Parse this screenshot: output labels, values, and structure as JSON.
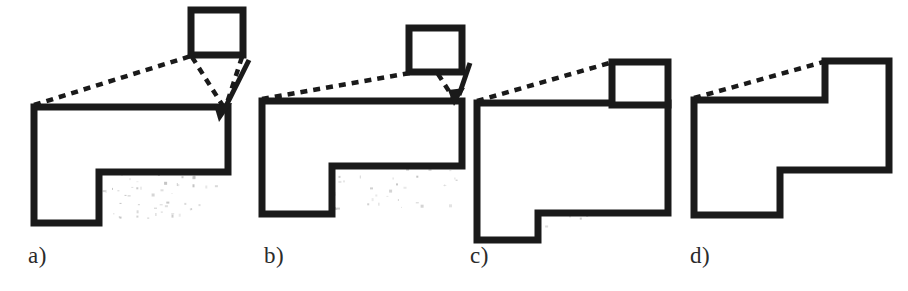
{
  "figure": {
    "kind": "line-drawing-diagram",
    "background_color": "#ffffff",
    "stroke_color": "#1a1a1a",
    "fill_color": "#ffffff",
    "dash_color": "#1a1a1a",
    "label_color": "#2b2b2b",
    "stroke_width": 7,
    "dash_width": 4,
    "dash_pattern": "7 6"
  },
  "labels": {
    "a": "a)",
    "b": "b)",
    "c": "c)",
    "d": "d)"
  },
  "panels": [
    {
      "id": "a",
      "label": "a)",
      "has_inset_box": true,
      "has_arrow": true,
      "dashed_line_count": 3,
      "inset_box": {
        "x": 191,
        "y": 10,
        "width": 52,
        "height": 45
      },
      "polygon_points": "34,107 228,107 228,172 99,172 99,223 34,223",
      "dash_lines": [
        {
          "x1": 34,
          "y1": 105,
          "x2": 191,
          "y2": 56
        },
        {
          "x1": 192,
          "y1": 57,
          "x2": 223,
          "y2": 106
        },
        {
          "x1": 242,
          "y1": 57,
          "x2": 226,
          "y2": 106
        }
      ],
      "arrow": {
        "x1": 247,
        "y1": 62,
        "x2": 221,
        "y2": 113
      }
    },
    {
      "id": "b",
      "label": "b)",
      "has_inset_box": true,
      "has_arrow": true,
      "dashed_line_count": 2,
      "inset_box": {
        "x": 409,
        "y": 28,
        "width": 53,
        "height": 44
      },
      "polygon_points": "262,101 462,101 462,166 332,166 332,214 262,214",
      "dash_lines": [
        {
          "x1": 262,
          "y1": 99,
          "x2": 409,
          "y2": 73
        },
        {
          "x1": 440,
          "y1": 74,
          "x2": 455,
          "y2": 99
        }
      ],
      "arrow": {
        "x1": 469,
        "y1": 62,
        "x2": 455,
        "y2": 100
      }
    },
    {
      "id": "c",
      "label": "c)",
      "has_inset_box": false,
      "has_arrow": false,
      "dashed_line_count": 1,
      "attached_box": {
        "x": 612,
        "y": 62,
        "width": 56,
        "height": 41
      },
      "polygon_points": "477,103 668,103 668,213 538,213 538,240 477,240",
      "dash_lines": [
        {
          "x1": 477,
          "y1": 101,
          "x2": 612,
          "y2": 62
        }
      ]
    },
    {
      "id": "d",
      "label": "d)",
      "has_inset_box": false,
      "has_arrow": false,
      "dashed_line_count": 1,
      "polygon_points": "694,100 825,100 825,61 889,61 889,170 780,170 780,215 694,215",
      "dash_lines": [
        {
          "x1": 694,
          "y1": 98,
          "x2": 826,
          "y2": 61
        }
      ]
    }
  ],
  "speckles": {
    "note": "scanner noise inside the large polygons of panels a, b and c",
    "color": "#b9b9b9",
    "clusters": [
      {
        "panel": "a",
        "x": 40,
        "y": 112,
        "width": 185,
        "height": 108,
        "count": 150
      },
      {
        "panel": "b",
        "x": 266,
        "y": 106,
        "width": 192,
        "height": 104,
        "count": 110
      },
      {
        "panel": "c",
        "x": 481,
        "y": 108,
        "width": 183,
        "height": 128,
        "count": 60
      }
    ]
  }
}
